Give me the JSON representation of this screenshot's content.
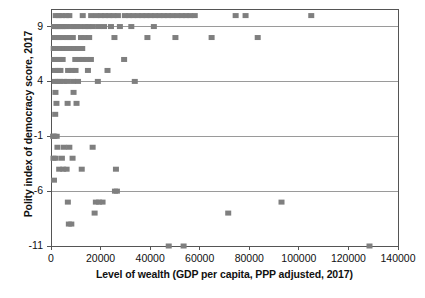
{
  "chart_data": {
    "type": "scatter",
    "title": "",
    "xlabel": "Level of wealth (GDP per capita, PPP adjusted, 2017)",
    "ylabel": "Polity index of democracy score, 2017",
    "xlim": [
      0,
      140000
    ],
    "ylim": [
      -11,
      10.6
    ],
    "grid": "horizontal",
    "legend": "none",
    "marker": {
      "shape": "square",
      "color": "#7f7f7f",
      "size_px": 6
    },
    "xticks": [
      0,
      20000,
      40000,
      60000,
      80000,
      100000,
      120000,
      140000
    ],
    "xtick_labels": [
      "0",
      "20000",
      "40000",
      "60000",
      "80000",
      "100000",
      "120000",
      "140000"
    ],
    "yticks": [
      9,
      4,
      -1,
      -6,
      -11
    ],
    "ytick_labels": [
      "9",
      "4",
      "-1",
      "-6",
      "-11"
    ],
    "points": [
      [
        1900,
        10
      ],
      [
        3100,
        10
      ],
      [
        4400,
        10
      ],
      [
        6100,
        10
      ],
      [
        7400,
        10
      ],
      [
        12800,
        10
      ],
      [
        16200,
        10
      ],
      [
        18400,
        10
      ],
      [
        20100,
        10
      ],
      [
        21800,
        10
      ],
      [
        23500,
        10
      ],
      [
        25200,
        10
      ],
      [
        27000,
        10
      ],
      [
        29800,
        10
      ],
      [
        31500,
        10
      ],
      [
        33200,
        10
      ],
      [
        35000,
        10
      ],
      [
        36800,
        10
      ],
      [
        38500,
        10
      ],
      [
        40200,
        10
      ],
      [
        42000,
        10
      ],
      [
        43800,
        10
      ],
      [
        45500,
        10
      ],
      [
        47200,
        10
      ],
      [
        49000,
        10
      ],
      [
        51000,
        10
      ],
      [
        52800,
        10
      ],
      [
        54500,
        10
      ],
      [
        56200,
        10
      ],
      [
        58000,
        10
      ],
      [
        74500,
        10
      ],
      [
        78500,
        10
      ],
      [
        105000,
        10
      ],
      [
        1200,
        9
      ],
      [
        2100,
        9
      ],
      [
        2900,
        9
      ],
      [
        3700,
        9
      ],
      [
        4600,
        9
      ],
      [
        5400,
        9
      ],
      [
        6300,
        9
      ],
      [
        7900,
        9
      ],
      [
        9200,
        9
      ],
      [
        10400,
        9
      ],
      [
        11800,
        9
      ],
      [
        13900,
        9
      ],
      [
        15100,
        9
      ],
      [
        16900,
        9
      ],
      [
        19200,
        9
      ],
      [
        21400,
        9
      ],
      [
        24200,
        9
      ],
      [
        27800,
        9
      ],
      [
        32400,
        9
      ],
      [
        41500,
        9
      ],
      [
        1400,
        8
      ],
      [
        2600,
        8
      ],
      [
        3500,
        8
      ],
      [
        4900,
        8
      ],
      [
        6400,
        8
      ],
      [
        7600,
        8
      ],
      [
        8800,
        8
      ],
      [
        12100,
        8
      ],
      [
        13600,
        8
      ],
      [
        15400,
        8
      ],
      [
        25600,
        8
      ],
      [
        38900,
        8
      ],
      [
        50200,
        8
      ],
      [
        64800,
        8
      ],
      [
        83400,
        8
      ],
      [
        1100,
        7
      ],
      [
        2000,
        7
      ],
      [
        3000,
        7
      ],
      [
        3900,
        7
      ],
      [
        4800,
        7
      ],
      [
        5600,
        7
      ],
      [
        6800,
        7
      ],
      [
        7800,
        7
      ],
      [
        9400,
        7
      ],
      [
        11200,
        7
      ],
      [
        12600,
        7
      ],
      [
        1300,
        6
      ],
      [
        2400,
        6
      ],
      [
        3400,
        6
      ],
      [
        4700,
        6
      ],
      [
        9800,
        6
      ],
      [
        11400,
        6
      ],
      [
        12900,
        6
      ],
      [
        14400,
        6
      ],
      [
        16100,
        6
      ],
      [
        29500,
        6
      ],
      [
        1600,
        5
      ],
      [
        2800,
        5
      ],
      [
        3800,
        5
      ],
      [
        6900,
        5
      ],
      [
        8400,
        5
      ],
      [
        9900,
        5
      ],
      [
        14900,
        5
      ],
      [
        22800,
        5
      ],
      [
        1500,
        4
      ],
      [
        2700,
        4
      ],
      [
        3600,
        4
      ],
      [
        5200,
        4
      ],
      [
        6600,
        4
      ],
      [
        8900,
        4
      ],
      [
        10900,
        4
      ],
      [
        18900,
        4
      ],
      [
        33800,
        4
      ],
      [
        1800,
        3
      ],
      [
        9100,
        3
      ],
      [
        2200,
        2
      ],
      [
        6700,
        2
      ],
      [
        10300,
        2
      ],
      [
        1700,
        1
      ],
      [
        900,
        -1
      ],
      [
        1000,
        -1
      ],
      [
        1400,
        -1
      ],
      [
        2300,
        -1
      ],
      [
        2600,
        -2
      ],
      [
        5200,
        -2
      ],
      [
        7400,
        -2
      ],
      [
        16800,
        -2
      ],
      [
        1000,
        -3
      ],
      [
        1900,
        -3
      ],
      [
        4400,
        -3
      ],
      [
        8700,
        -3
      ],
      [
        3300,
        -4
      ],
      [
        4900,
        -4
      ],
      [
        6300,
        -4
      ],
      [
        12400,
        -4
      ],
      [
        26200,
        -4
      ],
      [
        1200,
        -5
      ],
      [
        25800,
        -6
      ],
      [
        26600,
        -6
      ],
      [
        6800,
        -7
      ],
      [
        18100,
        -7
      ],
      [
        19400,
        -7
      ],
      [
        20800,
        -7
      ],
      [
        93000,
        -7
      ],
      [
        17600,
        -8
      ],
      [
        71500,
        -8
      ],
      [
        7200,
        -9
      ],
      [
        8200,
        -9
      ],
      [
        47500,
        -11
      ],
      [
        53500,
        -11
      ],
      [
        128500,
        -11
      ]
    ]
  },
  "caption": {
    "partial_text": ""
  }
}
